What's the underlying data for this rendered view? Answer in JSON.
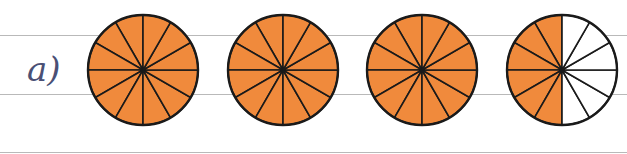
{
  "exercise": {
    "label": "a)",
    "label_color": "#4a5075"
  },
  "diagram": {
    "type": "fraction-circles",
    "slices_per_circle": 12,
    "fill_color": "#f08a3c",
    "stroke_color": "#1a1a1a",
    "circles": [
      {
        "shaded": 12,
        "total": 12
      },
      {
        "shaded": 12,
        "total": 12
      },
      {
        "shaded": 12,
        "total": 12
      },
      {
        "shaded": 6,
        "total": 12
      }
    ]
  }
}
